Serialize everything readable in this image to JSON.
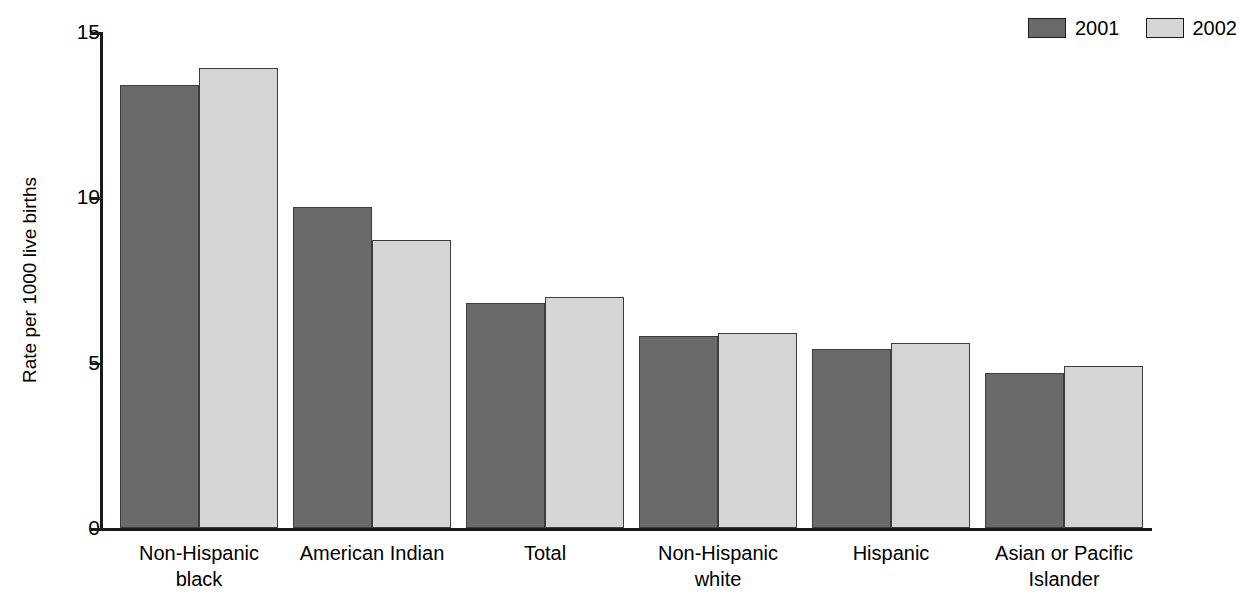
{
  "chart_data": {
    "type": "bar",
    "title": "",
    "subtitle": "",
    "xlabel": "",
    "ylabel": "Rate per 1000 live births",
    "ylim": [
      0,
      15
    ],
    "ytick_values": [
      0,
      5,
      10,
      15
    ],
    "ytick_labels": [
      "0",
      "5",
      "10",
      "15"
    ],
    "grid": false,
    "legend_position": "top-right",
    "categories": [
      "Non-Hispanic\nblack",
      "American Indian",
      "Total",
      "Non-Hispanic\nwhite",
      "Hispanic",
      "Asian or Pacific\nIslander"
    ],
    "series": [
      {
        "name": "2001",
        "color": "#6a6a6a",
        "values": [
          13.4,
          9.7,
          6.8,
          5.8,
          5.4,
          4.7
        ]
      },
      {
        "name": "2002",
        "color": "#d5d5d5",
        "values": [
          13.9,
          8.7,
          7.0,
          5.9,
          5.6,
          4.9
        ]
      }
    ]
  },
  "legend": {
    "entries": [
      {
        "label": "2001",
        "color": "#6a6a6a"
      },
      {
        "label": "2002",
        "color": "#d5d5d5"
      }
    ]
  },
  "axis": {
    "y_title": "Rate per 1000 live births",
    "y_ticks": [
      "15",
      "10",
      "5",
      "0"
    ]
  },
  "colors": {
    "series_2001": "#6a6a6a",
    "series_2002": "#d5d5d5",
    "bar_outline": "#3d3d3d",
    "axis": "#1a1a1a",
    "background": "#ffffff"
  }
}
